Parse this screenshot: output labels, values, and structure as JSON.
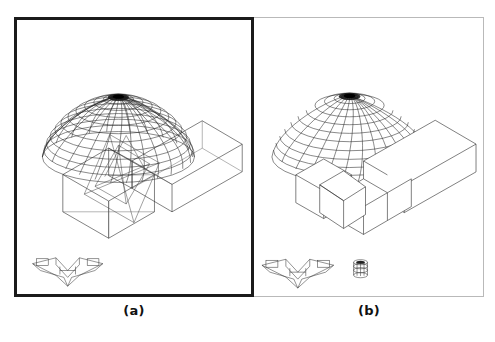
{
  "figure": {
    "type": "wireframe-cad-comparison",
    "background_color": "#ffffff",
    "panel_count": 2
  },
  "panels": [
    {
      "id": "a",
      "caption": "(a)",
      "border_color": "#1b1b1b",
      "border_width_px": 3,
      "rendering_mode": "full wireframe",
      "hidden_lines_visible": true,
      "objects": [
        "geodesic-dome",
        "l-shaped-building-block",
        "rectangular-wing-block",
        "pyramid-truss-structure",
        "chevron-reference-object"
      ]
    },
    {
      "id": "b",
      "caption": "(b)",
      "border_color": "#b9b9b9",
      "border_width_px": 1,
      "rendering_mode": "hidden-line removed",
      "hidden_lines_visible": false,
      "objects": [
        "geodesic-dome",
        "l-shaped-building-block",
        "rectangular-wing-block",
        "angled-connector-block",
        "chevron-reference-object",
        "cylinder-reference-object"
      ]
    }
  ],
  "dome": {
    "name": "geodesic-dome",
    "meridian_count": 24,
    "parallel_count": 12,
    "shape": "hemisphere"
  },
  "reference_objects": {
    "chevron": {
      "name": "chevron-reference-object",
      "shape": "v-shaped-plate"
    },
    "cylinder": {
      "name": "cylinder-reference-object",
      "shape": "short-cylinder",
      "present_in_panel": "b"
    }
  },
  "colors": {
    "background": "#ffffff",
    "wireframe_stroke": "#2a2a2a",
    "hidden_line_stroke": "#555555",
    "caption_text": "#111111",
    "panel_a_border": "#1b1b1b",
    "panel_b_border": "#b9b9b9"
  }
}
